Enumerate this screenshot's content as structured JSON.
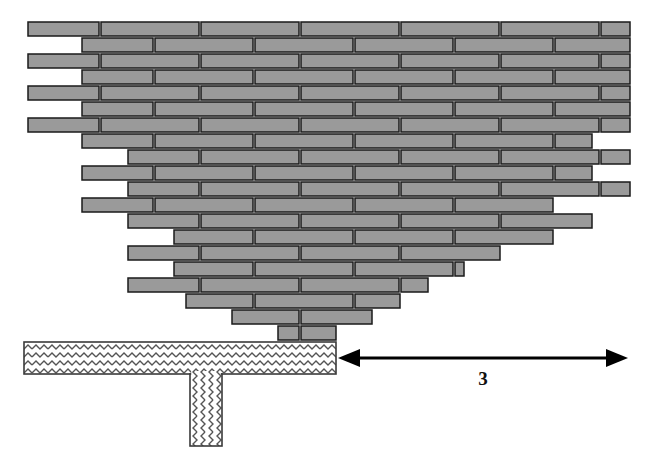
{
  "diagram": {
    "type": "engineering-section",
    "canvas": {
      "width": 654,
      "height": 454,
      "background": "#ffffff"
    }
  },
  "colors": {
    "brick_fill": "#9a9a9a",
    "brick_stroke": "#1a1a1a",
    "foundation_fill": "#ffffff",
    "foundation_stroke": "#3a3a3a",
    "hatch_stroke": "#555555",
    "dimension_stroke": "#000000",
    "label_color": "#111111",
    "background": "#ffffff"
  },
  "masonry": {
    "name": "corbelled-brick-stack",
    "course_count": 20,
    "course_height": 14,
    "course_pitch": 16,
    "top_y": 22,
    "brick_unit_width": 100,
    "mortar_gap": 2,
    "description": "Inverted stepped pyramid: upper courses full width, stepping inward toward the base.",
    "courses": [
      {
        "index": 1,
        "y": 22,
        "left": 28,
        "right": 630,
        "offset": 0,
        "bricks": 6
      },
      {
        "index": 2,
        "y": 38,
        "left": 82,
        "right": 630,
        "offset": 54,
        "bricks": 6
      },
      {
        "index": 3,
        "y": 54,
        "left": 28,
        "right": 630,
        "offset": 0,
        "bricks": 6
      },
      {
        "index": 4,
        "y": 70,
        "left": 82,
        "right": 630,
        "offset": 54,
        "bricks": 6
      },
      {
        "index": 5,
        "y": 86,
        "left": 28,
        "right": 630,
        "offset": 0,
        "bricks": 6
      },
      {
        "index": 6,
        "y": 102,
        "left": 82,
        "right": 630,
        "offset": 54,
        "bricks": 6
      },
      {
        "index": 7,
        "y": 118,
        "left": 28,
        "right": 630,
        "offset": 0,
        "bricks": 6
      },
      {
        "index": 8,
        "y": 134,
        "left": 82,
        "right": 592,
        "offset": 54,
        "bricks": 5
      },
      {
        "index": 9,
        "y": 150,
        "left": 128,
        "right": 630,
        "offset": 0,
        "bricks": 5
      },
      {
        "index": 10,
        "y": 166,
        "left": 82,
        "right": 592,
        "offset": 54,
        "bricks": 5
      },
      {
        "index": 11,
        "y": 182,
        "left": 128,
        "right": 630,
        "offset": 0,
        "bricks": 5
      },
      {
        "index": 12,
        "y": 198,
        "left": 82,
        "right": 556,
        "offset": 54,
        "bricks": 5
      },
      {
        "index": 13,
        "y": 214,
        "left": 128,
        "right": 592,
        "offset": 0,
        "bricks": 5
      },
      {
        "index": 14,
        "y": 230,
        "left": 174,
        "right": 556,
        "offset": 54,
        "bricks": 4
      },
      {
        "index": 15,
        "y": 246,
        "left": 128,
        "right": 500,
        "offset": 0,
        "bricks": 4
      },
      {
        "index": 16,
        "y": 262,
        "left": 174,
        "right": 464,
        "offset": 54,
        "bricks": 3
      },
      {
        "index": 17,
        "y": 278,
        "left": 128,
        "right": 428,
        "offset": 0,
        "bricks": 3
      },
      {
        "index": 18,
        "y": 294,
        "left": 186,
        "right": 400,
        "offset": 54,
        "bricks": 2
      },
      {
        "index": 19,
        "y": 310,
        "left": 232,
        "right": 372,
        "offset": 0,
        "bricks": 2
      },
      {
        "index": 20,
        "y": 326,
        "left": 278,
        "right": 336,
        "offset": 0,
        "bricks": 1
      }
    ]
  },
  "foundation": {
    "name": "hatched-concrete-foundation",
    "slab": {
      "x": 24,
      "y": 342,
      "width": 312,
      "height": 32
    },
    "stem": {
      "x": 190,
      "y": 374,
      "width": 32,
      "height": 72
    },
    "hatch_pattern": "zigzag-chevron",
    "hatch_bands": 2
  },
  "dimension": {
    "name": "horizontal-dimension-3",
    "label": "3",
    "start_x": 338,
    "end_x": 628,
    "y": 358,
    "label_x": 483,
    "label_y": 385,
    "arrow_style": "double-headed",
    "arrowhead_length": 22,
    "arrowhead_half_width": 9
  }
}
